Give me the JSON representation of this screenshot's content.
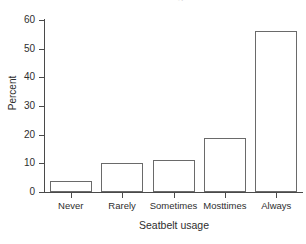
{
  "chart_data": {
    "type": "bar",
    "title": "Seatbelt usage",
    "subtitle": "",
    "xlabel": "Seatbelt usage",
    "ylabel": "Percent",
    "categories": [
      "Never",
      "Rarely",
      "Sometimes",
      "Mosttimes",
      "Always"
    ],
    "values": [
      4,
      10,
      11,
      19,
      56
    ],
    "ylim": [
      0,
      60
    ],
    "yticks": [
      0,
      10,
      20,
      30,
      40,
      50,
      60
    ],
    "ytick_labels": [
      "0",
      "10",
      "20",
      "30",
      "40",
      "50",
      "60"
    ],
    "grid": false,
    "legend": false,
    "legend_position": "none",
    "bar_fill_color": "#ffffff",
    "bar_edge_color": "#6a6a6a",
    "axis_color": "#4a4a4a",
    "background_color": "#ffffff",
    "text_color": "#2e2e2e"
  },
  "figure": {
    "cropped_title": "Seatbelt usage"
  }
}
